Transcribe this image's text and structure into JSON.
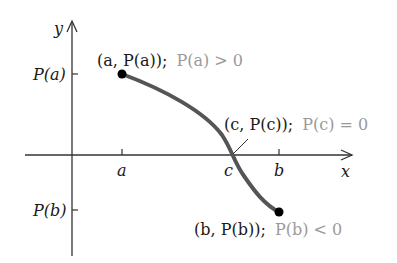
{
  "diagram": {
    "type": "intermediate-value-theorem-graph",
    "colors": {
      "axis": "#333333",
      "curve": "#555555",
      "point": "#000000",
      "text": "#1a1a1a",
      "condition_text": "#9a9a9a"
    },
    "axes": {
      "x_label": "x",
      "y_label": "y",
      "x_ticks": [
        {
          "label": "a"
        },
        {
          "label": "c"
        },
        {
          "label": "b"
        }
      ],
      "y_ticks": [
        {
          "label": "P(a)"
        },
        {
          "label": "P(b)"
        }
      ]
    },
    "points": [
      {
        "coord_label": "(a, P(a));",
        "condition": "P(a) > 0"
      },
      {
        "coord_label": "(c, P(c));",
        "condition": "P(c) = 0"
      },
      {
        "coord_label": "(b, P(b));",
        "condition": "P(b) < 0"
      }
    ]
  }
}
